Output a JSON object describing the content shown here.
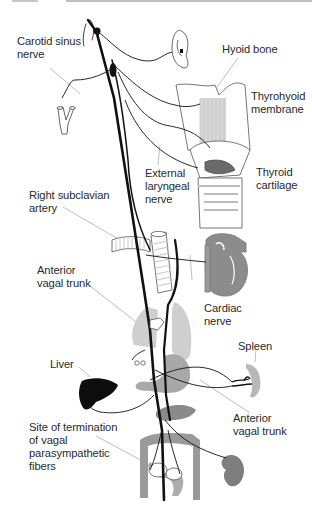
{
  "figure": {
    "labels": {
      "carotid_sinus_nerve": "Carotid sinus\nnerve",
      "hyoid_bone": "Hyoid bone",
      "thyrohyoid_membrane": "Thyrohyoid\nmembrane",
      "external_laryngeal_nerve": "External\nlaryngeal\nnerve",
      "thyroid_cartilage": "Thyroid\ncartilage",
      "right_subclavian_artery": "Right subclavian\nartery",
      "anterior_vagal_trunk_upper": "Anterior\nvagal trunk",
      "cardiac_nerve": "Cardiac\nnerve",
      "spleen": "Spleen",
      "liver": "Liver",
      "anterior_vagal_trunk_lower": "Anterior\nvagal trunk",
      "site_of_termination": "Site of termination\nof vagal\nparasympathetic\nfibers"
    },
    "colors": {
      "nerve": "#111111",
      "organ_gray": "#8c8c8c",
      "organ_light": "#cfcfcf",
      "organ_dark": "#6a6a6a",
      "liver": "#0d0d0d",
      "leader_line": "#b5b5b5",
      "outline": "#555555"
    }
  }
}
